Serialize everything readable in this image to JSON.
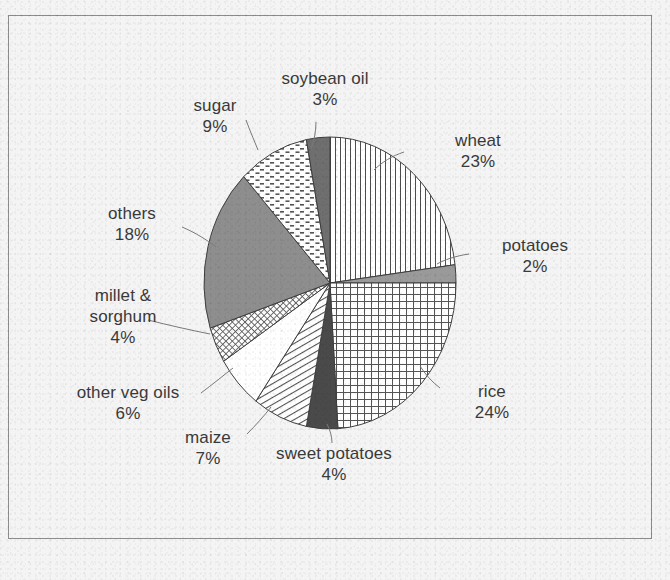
{
  "figure": {
    "frame_border_color": "#8d8d8d",
    "background_color": "#f4f4f4",
    "text_color": "#3a3a3a"
  },
  "chart_data": {
    "type": "pie",
    "title": "",
    "subtitle": "",
    "xlabel": "",
    "ylabel": "",
    "legend_position": "none",
    "grid": false,
    "units": "percent",
    "total": 100,
    "start_angle_deg": 0,
    "direction": "clockwise",
    "categories": [
      "wheat",
      "potatoes",
      "rice",
      "sweet potatoes",
      "maize",
      "other veg oils",
      "millet & sorghum",
      "others",
      "sugar",
      "soybean oil"
    ],
    "values": [
      23,
      2,
      24,
      4,
      7,
      6,
      4,
      18,
      9,
      3
    ],
    "slices": [
      {
        "label": "wheat",
        "value": 23,
        "pct_text": "23%",
        "pattern": "vertical-lines",
        "fill": "#ffffff"
      },
      {
        "label": "potatoes",
        "value": 2,
        "pct_text": "2%",
        "pattern": "solid-gray",
        "fill": "#9a9a9a"
      },
      {
        "label": "rice",
        "value": 24,
        "pct_text": "24%",
        "pattern": "crosshatch-grid",
        "fill": "#ffffff"
      },
      {
        "label": "sweet potatoes",
        "value": 4,
        "pct_text": "4%",
        "pattern": "solid-dark",
        "fill": "#4a4a4a"
      },
      {
        "label": "maize",
        "value": 7,
        "pct_text": "7%",
        "pattern": "diagonal-lines",
        "fill": "#ffffff"
      },
      {
        "label": "other veg oils",
        "value": 6,
        "pct_text": "6%",
        "pattern": "solid-white",
        "fill": "#ffffff"
      },
      {
        "label": "millet & sorghum",
        "value": 4,
        "pct_text": "4%",
        "pattern": "fine-crosshatch",
        "fill": "#ffffff"
      },
      {
        "label": "others",
        "value": 18,
        "pct_text": "18%",
        "pattern": "solid-medium",
        "fill": "#8e8e8e"
      },
      {
        "label": "sugar",
        "value": 9,
        "pct_text": "9%",
        "pattern": "dashed-dots",
        "fill": "#ffffff"
      },
      {
        "label": "soybean oil",
        "value": 3,
        "pct_text": "3%",
        "pattern": "solid-darkgray",
        "fill": "#6f6f6f"
      }
    ]
  },
  "labels": {
    "soybean_oil": {
      "name": "soybean oil",
      "pct": "3%"
    },
    "sugar": {
      "name": "sugar",
      "pct": "9%"
    },
    "wheat": {
      "name": "wheat",
      "pct": "23%"
    },
    "potatoes": {
      "name": "potatoes",
      "pct": "2%"
    },
    "rice": {
      "name": "rice",
      "pct": "24%"
    },
    "sweet_potatoes": {
      "name": "sweet potatoes",
      "pct": "4%"
    },
    "maize": {
      "name": "maize",
      "pct": "7%"
    },
    "other_veg_oils": {
      "name": "other veg oils",
      "pct": "6%"
    },
    "millet_line1": {
      "name": "millet &"
    },
    "millet_line2": {
      "name": "sorghum",
      "pct": "4%"
    },
    "others": {
      "name": "others",
      "pct": "18%"
    }
  }
}
